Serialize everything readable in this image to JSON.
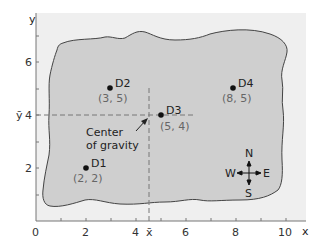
{
  "axes": {
    "x_label": "x",
    "y_label": "y",
    "x_ticks": [
      "0",
      "2",
      "4",
      "6",
      "8",
      "10"
    ],
    "y_ticks": [
      "2",
      "4",
      "6"
    ],
    "x_mean_label": "x̄",
    "y_mean_label": "ȳ"
  },
  "points": [
    {
      "name": "D1",
      "coord": "(2, 2)"
    },
    {
      "name": "D2",
      "coord": "(3, 5)"
    },
    {
      "name": "D3",
      "coord": "(5, 4)"
    },
    {
      "name": "D4",
      "coord": "(8, 5)"
    }
  ],
  "annotation": {
    "line1": "Center",
    "line2": "of gravity"
  },
  "compass": {
    "n": "N",
    "s": "S",
    "e": "E",
    "w": "W"
  },
  "colors": {
    "plot_bg": "#efefef",
    "region_fill": "#cfcfcf",
    "outline": "#444444"
  }
}
